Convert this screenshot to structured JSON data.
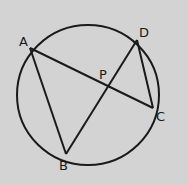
{
  "diagram": {
    "type": "circle-chords",
    "background": "#d3d3d3",
    "stroke": "#1a1a1a",
    "circle": {
      "cx": 88,
      "cy": 95,
      "r": 72
    },
    "points": [
      {
        "id": "A",
        "label": "A",
        "x": 30,
        "y": 48,
        "lx": 18,
        "ly": 45
      },
      {
        "id": "B",
        "label": "B",
        "x": 66,
        "y": 154,
        "lx": 59,
        "ly": 170
      },
      {
        "id": "C",
        "label": "C",
        "x": 153,
        "y": 108,
        "lx": 156,
        "ly": 121
      },
      {
        "id": "D",
        "label": "D",
        "x": 137,
        "y": 40,
        "lx": 140,
        "ly": 36
      },
      {
        "id": "P",
        "label": "P",
        "x": 106,
        "y": 86,
        "lx": 99,
        "ly": 79
      }
    ],
    "segments": [
      {
        "from": "A",
        "to": "C"
      },
      {
        "from": "A",
        "to": "B"
      },
      {
        "from": "B",
        "to": "D"
      },
      {
        "from": "D",
        "to": "C"
      }
    ]
  }
}
